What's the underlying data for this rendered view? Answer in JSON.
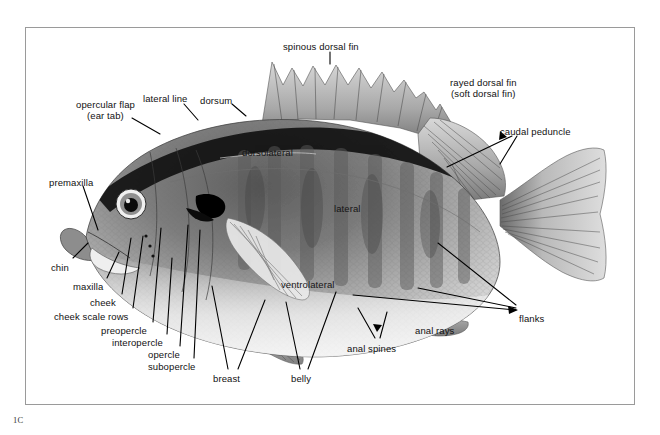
{
  "figure": {
    "plate_id": "1C",
    "frame_color": "#9a9a9a",
    "background_color": "#ffffff",
    "label_color": "#111111"
  },
  "labels": [
    {
      "id": "spinous-dorsal-fin",
      "text": "spinous dorsal fin",
      "x": 283,
      "y": 41,
      "align": "left",
      "on_body": false
    },
    {
      "id": "rayed-dorsal-fin",
      "text": "rayed dorsal fin\n(soft dorsal fin)",
      "x": 450,
      "y": 77,
      "align": "center",
      "on_body": false
    },
    {
      "id": "caudal-peduncle",
      "text": "caudal peduncle",
      "x": 500,
      "y": 126,
      "align": "left",
      "on_body": false
    },
    {
      "id": "lateral-line",
      "text": "lateral line",
      "x": 143,
      "y": 93,
      "align": "left",
      "on_body": false
    },
    {
      "id": "dorsum",
      "text": "dorsum",
      "x": 200,
      "y": 95,
      "align": "left",
      "on_body": false
    },
    {
      "id": "opercular-flap",
      "text": "opercular flap\n(ear tab)",
      "x": 76,
      "y": 99,
      "align": "center",
      "on_body": false
    },
    {
      "id": "dorsolateral",
      "text": "dorsolateral",
      "x": 242,
      "y": 147,
      "align": "left",
      "on_body": true
    },
    {
      "id": "lateral",
      "text": "lateral",
      "x": 334,
      "y": 203,
      "align": "left",
      "on_body": true
    },
    {
      "id": "ventrolateral",
      "text": "ventrolateral",
      "x": 281,
      "y": 279,
      "align": "left",
      "on_body": true
    },
    {
      "id": "premaxilla",
      "text": "premaxilla",
      "x": 49,
      "y": 177,
      "align": "left",
      "on_body": false
    },
    {
      "id": "chin",
      "text": "chin",
      "x": 51,
      "y": 262,
      "align": "left",
      "on_body": false
    },
    {
      "id": "maxilla",
      "text": "maxilla",
      "x": 73,
      "y": 281,
      "align": "left",
      "on_body": false
    },
    {
      "id": "cheek",
      "text": "cheek",
      "x": 90,
      "y": 297,
      "align": "left",
      "on_body": false
    },
    {
      "id": "cheek-scale-rows",
      "text": "cheek scale rows",
      "x": 54,
      "y": 311,
      "align": "left",
      "on_body": false
    },
    {
      "id": "preopercle",
      "text": "preopercle",
      "x": 101,
      "y": 325,
      "align": "left",
      "on_body": false
    },
    {
      "id": "interopercle",
      "text": "interopercle",
      "x": 112,
      "y": 337,
      "align": "left",
      "on_body": false
    },
    {
      "id": "opercle",
      "text": "opercle",
      "x": 148,
      "y": 349,
      "align": "left",
      "on_body": false
    },
    {
      "id": "subopercle",
      "text": "subopercle",
      "x": 148,
      "y": 361,
      "align": "left",
      "on_body": false
    },
    {
      "id": "breast",
      "text": "breast",
      "x": 213,
      "y": 373,
      "align": "left",
      "on_body": false
    },
    {
      "id": "belly",
      "text": "belly",
      "x": 291,
      "y": 373,
      "align": "left",
      "on_body": false
    },
    {
      "id": "anal-spines",
      "text": "anal spines",
      "x": 347,
      "y": 343,
      "align": "left",
      "on_body": false
    },
    {
      "id": "anal-rays",
      "text": "anal rays",
      "x": 415,
      "y": 325,
      "align": "left",
      "on_body": false
    },
    {
      "id": "flanks",
      "text": "flanks",
      "x": 519,
      "y": 313,
      "align": "left",
      "on_body": false
    }
  ],
  "leaders": [
    {
      "id": "leader-spinous-dorsal-fin",
      "points": "330,52 330,64"
    },
    {
      "id": "leader-caudal-peduncle-a",
      "points": "512,136 447,167"
    },
    {
      "id": "leader-caudal-peduncle-b",
      "points": "517,136 500,164"
    },
    {
      "id": "leader-lateral-line",
      "points": "184,104 198,120"
    },
    {
      "id": "leader-dorsum",
      "points": "232,104 246,116"
    },
    {
      "id": "leader-opercular-flap",
      "points": "132,118 160,134"
    },
    {
      "id": "leader-premaxilla",
      "points": "83,186 98,230"
    },
    {
      "id": "leader-chin",
      "points": "73,258 88,243"
    },
    {
      "id": "leader-maxilla",
      "points": "107,278 119,252"
    },
    {
      "id": "leader-cheek",
      "points": "122,294 131,238"
    },
    {
      "id": "leader-cheek-scale-rows",
      "points": "133,308 143,236"
    },
    {
      "id": "leader-preopercle",
      "points": "153,322 161,228"
    },
    {
      "id": "leader-interopercle",
      "points": "167,334 172,258"
    },
    {
      "id": "leader-opercle",
      "points": "180,346 188,225"
    },
    {
      "id": "leader-subopercle",
      "points": "194,358 200,230"
    },
    {
      "id": "leader-breast-a",
      "points": "228,369 212,286"
    },
    {
      "id": "leader-breast-b",
      "points": "238,369 265,300"
    },
    {
      "id": "leader-belly-a",
      "points": "300,369 286,302"
    },
    {
      "id": "leader-belly-b",
      "points": "308,369 336,292"
    },
    {
      "id": "leader-anal-spines-a",
      "points": "375,338 358,308"
    },
    {
      "id": "leader-anal-spines-b",
      "points": "380,338 387,312"
    },
    {
      "id": "leader-flanks-a",
      "points": "516,308 418,288"
    },
    {
      "id": "leader-flanks-b",
      "points": "516,310 353,295"
    },
    {
      "id": "leader-flanks-c",
      "points": "516,305 438,243"
    }
  ]
}
